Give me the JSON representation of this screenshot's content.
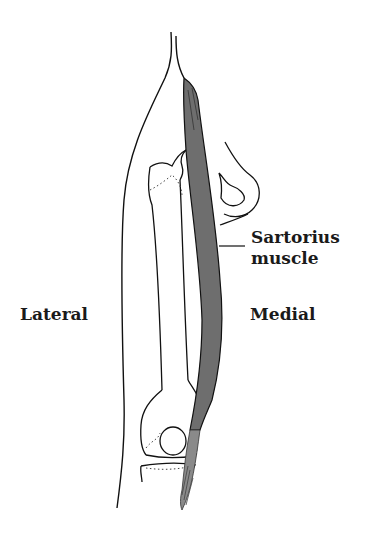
{
  "figure": {
    "colors": {
      "outline": "#111111",
      "muscle_fill": "#6e6e6e",
      "muscle_lower_fill": "#8a8a8a",
      "background": "#ffffff"
    }
  },
  "labels": {
    "lateral": "Lateral",
    "medial": "Medial",
    "sartorius_line1": "Sartorius",
    "sartorius_line2": "muscle"
  }
}
